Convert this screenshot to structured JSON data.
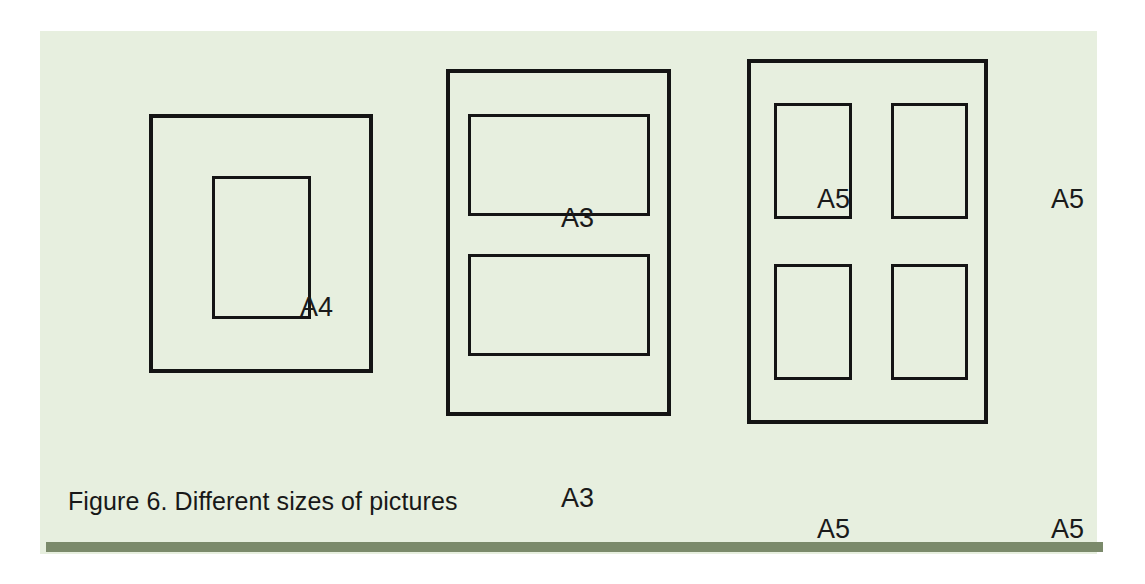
{
  "figure": {
    "caption": "Figure 6. Different sizes of pictures",
    "panel_background": "#e7efdf",
    "line_color": "#141414",
    "rule_color": "#7b8a6b",
    "page_background": "#ffffff",
    "groups": [
      {
        "id": "a4-group",
        "description": "single A4 picture inside a frame",
        "count": 1,
        "labels": [
          "A4"
        ]
      },
      {
        "id": "a3-group",
        "description": "two A3 landscape pictures stacked inside a frame",
        "count": 2,
        "labels": [
          "A3",
          "A3"
        ]
      },
      {
        "id": "a5-group",
        "description": "four A5 portrait pictures in a two by two grid inside a frame",
        "count": 4,
        "labels": [
          "A5",
          "A5",
          "A5",
          "A5"
        ]
      }
    ]
  }
}
